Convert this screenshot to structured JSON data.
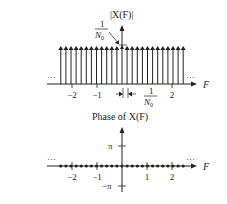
{
  "magnitude_plot": {
    "title": "|X(F)|",
    "height_label_num": "1",
    "height_label_den": "N",
    "height_label_sub": "0",
    "spacing_label_num": "1",
    "spacing_label_den": "N",
    "spacing_label_sub": "0",
    "x_axis_label": "F",
    "ellipsis_left": "···",
    "ellipsis_right": "···",
    "ticks": [
      {
        "label": "−2",
        "value": -2
      },
      {
        "label": "−1",
        "value": -1
      },
      {
        "label": "2",
        "value": 2
      }
    ]
  },
  "phase_plot": {
    "title": "Phase of X(F)",
    "y_tick_pos": "π",
    "y_tick_neg": "−π",
    "x_axis_label": "F",
    "ellipsis_left": "···",
    "ellipsis_right": "···",
    "ticks": [
      {
        "label": "−2",
        "value": -2
      },
      {
        "label": "−1",
        "value": -1
      },
      {
        "label": "1",
        "value": 1
      },
      {
        "label": "2",
        "value": 2
      }
    ]
  },
  "colors": {
    "ink": "#222222",
    "background": "#ffffff"
  }
}
